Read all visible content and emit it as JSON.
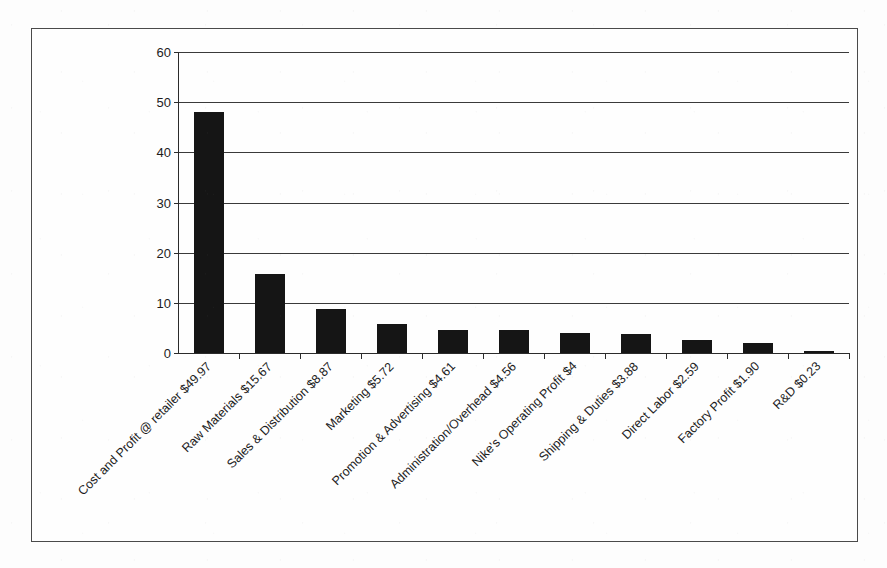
{
  "chart_data": {
    "type": "bar",
    "title": "",
    "xlabel": "",
    "ylabel": "",
    "ylim": [
      0,
      60
    ],
    "ytick_values": [
      0,
      10,
      20,
      30,
      40,
      50,
      60
    ],
    "ytick_labels": [
      "0",
      "10",
      "20",
      "30",
      "40",
      "50",
      "60"
    ],
    "grid": true,
    "legend": "none",
    "orientation": "vertical",
    "bar_color": "#151515",
    "categories": [
      "Cost and Profit @ retailer $49.97",
      "Raw Materials $15.67",
      "Sales & Distribution $8.87",
      "Marketing $5.72",
      "Promotion & Advertising $4.61",
      "Administration/Overhead $4.56",
      "Nike's Operating Profit $4",
      "Shipping & Duties $3.88",
      "Direct Labor $2.59",
      "Factory Profit $1.90",
      "R&D $0.23"
    ],
    "values": [
      47.97,
      15.67,
      8.87,
      5.72,
      4.61,
      4.56,
      4.0,
      3.88,
      2.59,
      1.9,
      0.23
    ],
    "series": [
      {
        "name": "Cost breakdown (USD)",
        "values": [
          47.97,
          15.67,
          8.87,
          5.72,
          4.61,
          4.56,
          4.0,
          3.88,
          2.59,
          1.9,
          0.23
        ]
      }
    ],
    "xtick_label_rotation_deg": -45
  },
  "figure": {
    "frame_color": "#4a4a4a",
    "background_color": "#fefefe",
    "axis_color": "#2b2b2b"
  }
}
